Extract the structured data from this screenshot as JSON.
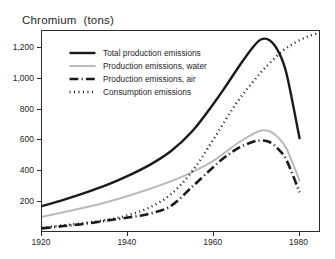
{
  "chart_data": {
    "type": "line",
    "title": "Chromium  (tons)",
    "xlabel": "",
    "ylabel": "tons",
    "xlim": [
      1920,
      1985
    ],
    "ylim": [
      0,
      1310
    ],
    "grid": false,
    "legend_position": "upper-left-inside",
    "xticks": [
      1920,
      1940,
      1960,
      1980
    ],
    "xticklabels": [
      "1920",
      "1940",
      "1960",
      "1980"
    ],
    "yticks": [
      200,
      400,
      600,
      800,
      1000,
      1200
    ],
    "yticklabels": [
      "200",
      "400",
      "600",
      "800",
      "1,000",
      "1,200"
    ],
    "series": [
      {
        "name": "Total production emissions",
        "style": "solid",
        "color": "#1a1a1a",
        "width": 2.4,
        "x": [
          1920,
          1925,
          1930,
          1935,
          1940,
          1945,
          1950,
          1955,
          1960,
          1963,
          1966,
          1969,
          1971,
          1973,
          1975,
          1977,
          1980
        ],
        "y": [
          175,
          215,
          260,
          310,
          370,
          440,
          530,
          660,
          840,
          960,
          1085,
          1200,
          1255,
          1250,
          1180,
          1030,
          615
        ]
      },
      {
        "name": "Production emissions, water",
        "style": "solid",
        "color": "#b9b9b9",
        "width": 2.0,
        "x": [
          1920,
          1925,
          1930,
          1935,
          1940,
          1945,
          1950,
          1955,
          1960,
          1963,
          1966,
          1969,
          1971,
          1973,
          1975,
          1977,
          1980
        ],
        "y": [
          105,
          135,
          165,
          200,
          240,
          285,
          335,
          395,
          470,
          530,
          590,
          640,
          665,
          660,
          620,
          545,
          340
        ]
      },
      {
        "name": "Production emissions, air",
        "style": "dashdot",
        "color": "#1a1a1a",
        "width": 2.6,
        "x": [
          1920,
          1925,
          1930,
          1935,
          1940,
          1945,
          1950,
          1955,
          1960,
          1963,
          1966,
          1969,
          1971,
          1973,
          1975,
          1977,
          1980
        ],
        "y": [
          30,
          45,
          60,
          80,
          100,
          125,
          175,
          300,
          430,
          500,
          555,
          590,
          600,
          590,
          545,
          470,
          265
        ]
      },
      {
        "name": "Consumption emissions",
        "style": "dotted",
        "color": "#1a1a1a",
        "width": 2.4,
        "x": [
          1920,
          1925,
          1930,
          1935,
          1940,
          1945,
          1950,
          1955,
          1960,
          1965,
          1970,
          1973,
          1976,
          1979,
          1982,
          1985
        ],
        "y": [
          35,
          50,
          65,
          85,
          115,
          165,
          250,
          400,
          610,
          830,
          1010,
          1100,
          1180,
          1235,
          1275,
          1300
        ]
      }
    ]
  },
  "legend": {
    "items": [
      {
        "label": "Total production emissions",
        "style": "solid",
        "color": "#1a1a1a"
      },
      {
        "label": "Production emissions, water",
        "style": "solid",
        "color": "#b9b9b9"
      },
      {
        "label": "Production emissions, air",
        "style": "dashdot",
        "color": "#1a1a1a"
      },
      {
        "label": "Consumption emissions",
        "style": "dotted",
        "color": "#1a1a1a"
      }
    ]
  },
  "colors": {
    "frame": "#2b2b2b",
    "text": "#232323",
    "background": "#ffffff",
    "series_dark": "#1a1a1a",
    "series_light": "#b9b9b9"
  }
}
